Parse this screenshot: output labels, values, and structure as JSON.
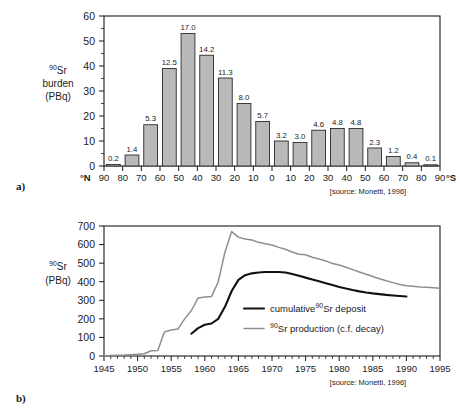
{
  "figure": {
    "panel_a_label": "a)",
    "panel_b_label": "b)",
    "source_note": "[source: Monetti, 1996]"
  },
  "chart_data": [
    {
      "type": "bar",
      "panel": "a",
      "title": "",
      "ylabel_line1": "Sr",
      "ylabel_sup": "90",
      "ylabel_line2": "burden",
      "ylabel_line3": "(PBq)",
      "ylim": [
        0,
        60
      ],
      "yticks": [
        0,
        10,
        20,
        30,
        40,
        50,
        60
      ],
      "ytick_labels": [
        "0",
        "10",
        "20",
        "30",
        "40",
        "50",
        "60"
      ],
      "y_minor_step": 5,
      "xlabel_left": "°N",
      "xlabel_right": "°S",
      "grid": false,
      "categories": [
        "90-80 N",
        "80-70 N",
        "70-60 N",
        "60-50 N",
        "50-40 N",
        "40-30 N",
        "30-20 N",
        "20-10 N",
        "10-0 N",
        "0-10 S",
        "10-20 S",
        "20-30 S",
        "30-40 S",
        "40-50 S",
        "50-60 S",
        "60-70 S",
        "70-80 S",
        "80-90 S"
      ],
      "xtick_labels": [
        "90",
        "80",
        "70",
        "60",
        "50",
        "40",
        "30",
        "20",
        "10",
        "0",
        "10",
        "20",
        "30",
        "40",
        "50",
        "60",
        "70",
        "80",
        "90"
      ],
      "data_labels": [
        "0.2",
        "1.4",
        "5.3",
        "12.5",
        "17.0",
        "14.2",
        "11.3",
        "8.0",
        "5.7",
        "3.2",
        "3.0",
        "4.6",
        "4.8",
        "4.8",
        "2.3",
        "1.2",
        "0.4",
        "0.1"
      ],
      "percent_values": [
        0.2,
        1.4,
        5.3,
        12.5,
        17.0,
        14.2,
        11.3,
        8.0,
        5.7,
        3.2,
        3.0,
        4.6,
        4.8,
        4.8,
        2.3,
        1.2,
        0.4,
        0.1
      ],
      "values": [
        0.6,
        4.4,
        16.5,
        39.0,
        53.0,
        44.3,
        35.2,
        25.0,
        17.8,
        10.0,
        9.4,
        14.3,
        15.0,
        15.0,
        7.2,
        3.8,
        1.3,
        0.3
      ],
      "source": "[source: Monetti, 1996]"
    },
    {
      "type": "line",
      "panel": "b",
      "title": "",
      "ylabel_sup": "90",
      "ylabel_line1": "Sr",
      "ylabel_line2": "(PBq)",
      "ylim": [
        0,
        700
      ],
      "yticks": [
        0,
        100,
        200,
        300,
        400,
        500,
        600,
        700
      ],
      "ytick_labels": [
        "0",
        "100",
        "200",
        "300",
        "400",
        "500",
        "600",
        "700"
      ],
      "xlim": [
        1945,
        1995
      ],
      "xticks": [
        1945,
        1950,
        1955,
        1960,
        1965,
        1970,
        1975,
        1980,
        1985,
        1990,
        1995
      ],
      "xtick_labels": [
        "1945",
        "1950",
        "1955",
        "1960",
        "1965",
        "1970",
        "1975",
        "1980",
        "1985",
        "1990",
        "1995"
      ],
      "x_minor_step": 1,
      "grid": false,
      "legend_position": "inside-lower-right",
      "series": [
        {
          "name": "cumulative 90Sr deposit",
          "legend_pre": "cumulative",
          "legend_sup": "90",
          "legend_post": "Sr deposit",
          "color": "#111111",
          "x": [
            1958,
            1959,
            1960,
            1961,
            1962,
            1963,
            1964,
            1965,
            1966,
            1967,
            1968,
            1969,
            1970,
            1971,
            1972,
            1973,
            1974,
            1975,
            1976,
            1977,
            1978,
            1979,
            1980,
            1981,
            1982,
            1983,
            1984,
            1985,
            1986,
            1987,
            1988,
            1989,
            1990
          ],
          "y": [
            120,
            150,
            168,
            175,
            200,
            265,
            350,
            410,
            435,
            445,
            450,
            452,
            452,
            452,
            450,
            442,
            432,
            422,
            412,
            402,
            392,
            382,
            372,
            363,
            355,
            348,
            342,
            337,
            333,
            329,
            326,
            323,
            320
          ]
        },
        {
          "name": "90Sr production (c.f. decay)",
          "legend_sup": "90",
          "legend_pre": "",
          "legend_post": "Sr production (c.f. decay)",
          "color": "#8e8e8e",
          "x": [
            1945,
            1946,
            1947,
            1948,
            1949,
            1950,
            1951,
            1952,
            1953,
            1954,
            1955,
            1956,
            1957,
            1958,
            1959,
            1960,
            1961,
            1962,
            1963,
            1964,
            1965,
            1966,
            1967,
            1968,
            1969,
            1970,
            1971,
            1972,
            1973,
            1974,
            1975,
            1976,
            1977,
            1978,
            1979,
            1980,
            1981,
            1982,
            1983,
            1984,
            1985,
            1986,
            1987,
            1988,
            1989,
            1990,
            1991,
            1992,
            1993,
            1994,
            1995
          ],
          "y": [
            2,
            3,
            4,
            5,
            7,
            9,
            12,
            28,
            30,
            130,
            140,
            145,
            200,
            245,
            312,
            318,
            320,
            400,
            560,
            670,
            640,
            630,
            625,
            612,
            605,
            598,
            585,
            575,
            560,
            548,
            545,
            532,
            522,
            512,
            498,
            490,
            478,
            465,
            452,
            440,
            428,
            416,
            405,
            395,
            385,
            378,
            375,
            372,
            370,
            368,
            365
          ]
        }
      ],
      "source": "[source: Monetti, 1996]"
    }
  ]
}
